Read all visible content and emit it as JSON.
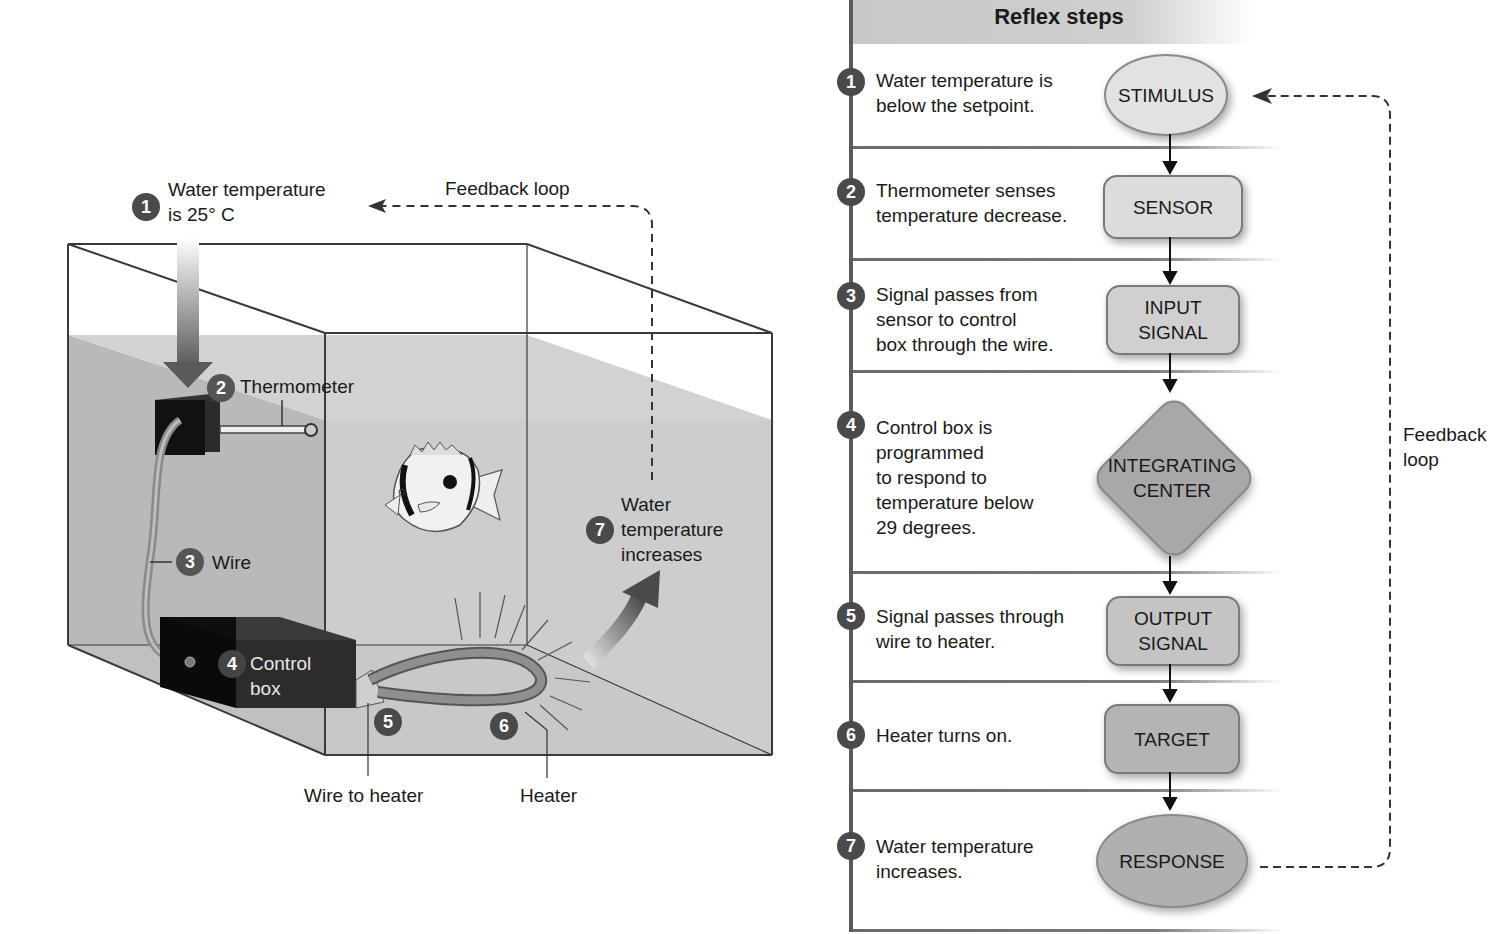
{
  "aquarium": {
    "labels": {
      "step1_num": "1",
      "step1_text_line1": "Water temperature",
      "step1_text_line2": "is 25° C",
      "feedback_loop": "Feedback loop",
      "step2_num": "2",
      "step2_text": "Thermometer",
      "step3_num": "3",
      "step3_text": "Wire",
      "step4_num": "4",
      "step4_text_line1": "Control",
      "step4_text_line2": "box",
      "step5_num": "5",
      "step6_num": "6",
      "step7_num": "7",
      "step7_text_line1": "Water",
      "step7_text_line2": "temperature",
      "step7_text_line3": "increases",
      "wire_to_heater": "Wire to heater",
      "heater": "Heater"
    },
    "colors": {
      "water": "#c9c9c9",
      "water_back": "#d4d4d4",
      "box_dark": "#2a2a2a",
      "heater": "#8a8a8a",
      "arrow": "#5a5a5a"
    }
  },
  "reflex": {
    "title": "Reflex steps",
    "steps": [
      {
        "num": "1",
        "lines": [
          "Water temperature is",
          "below the setpoint."
        ],
        "node": [
          "STIMULUS"
        ],
        "shape": "oval"
      },
      {
        "num": "2",
        "lines": [
          "Thermometer senses",
          "temperature decrease."
        ],
        "node": [
          "SENSOR"
        ],
        "shape": "rect"
      },
      {
        "num": "3",
        "lines": [
          "Signal passes from",
          "sensor to control",
          "box through the wire."
        ],
        "node": [
          "INPUT",
          "SIGNAL"
        ],
        "shape": "rect"
      },
      {
        "num": "4",
        "lines": [
          "Control box is",
          "programmed",
          "to respond to",
          "temperature below",
          "29 degrees."
        ],
        "node": [
          "INTEGRATING",
          "CENTER"
        ],
        "shape": "diamond"
      },
      {
        "num": "5",
        "lines": [
          "Signal passes through",
          "wire to heater."
        ],
        "node": [
          "OUTPUT",
          "SIGNAL"
        ],
        "shape": "rect"
      },
      {
        "num": "6",
        "lines": [
          "Heater turns on."
        ],
        "node": [
          "TARGET"
        ],
        "shape": "rect"
      },
      {
        "num": "7",
        "lines": [
          "Water temperature",
          "increases."
        ],
        "node": [
          "RESPONSE"
        ],
        "shape": "oval"
      }
    ],
    "feedback_label_line1": "Feedback",
    "feedback_label_line2": "loop",
    "colors": {
      "header": "#cccccc",
      "stimulus": "#e2e2e2",
      "sensor": "#dcdcdc",
      "input": "#d0d0d0",
      "integrating": "#a8a8a8",
      "output": "#c4c4c4",
      "target": "#b4b4b4",
      "response": "#b0b0b0"
    }
  }
}
